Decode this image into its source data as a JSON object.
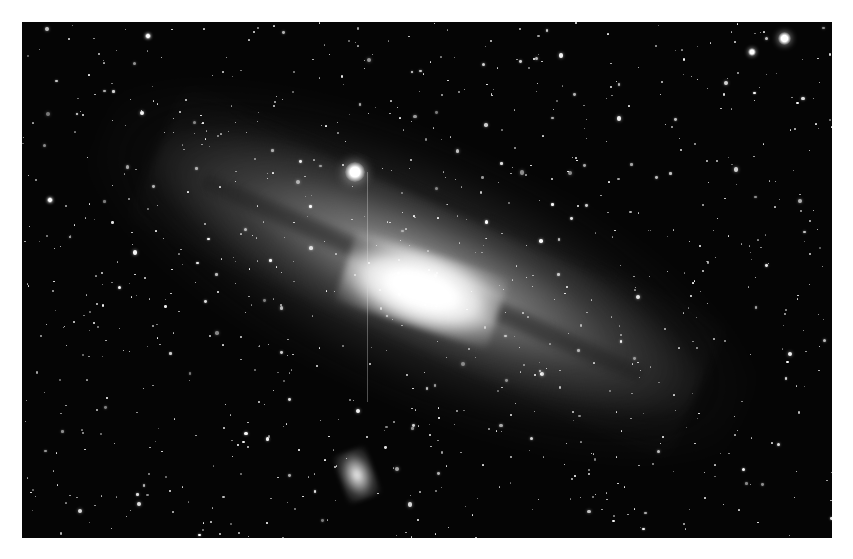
{
  "image": {
    "subject": "Andromeda Galaxy (M31) with companion galaxy",
    "style": "grayscale astrophotograph",
    "frame": {
      "x": 22,
      "y": 22,
      "width": 810,
      "height": 516
    },
    "background_color": "#ffffff",
    "sky_color": "#050505",
    "galaxy": {
      "core_center": [
        420,
        280
      ],
      "tilt_degrees": 24,
      "core_color": "#ffffff"
    },
    "companion_galaxy": {
      "center": [
        355,
        470
      ]
    },
    "bright_stars": [
      {
        "x": 355,
        "y": 172,
        "r": 8
      },
      {
        "x": 784,
        "y": 38,
        "r": 5
      },
      {
        "x": 752,
        "y": 52,
        "r": 3
      },
      {
        "x": 148,
        "y": 36,
        "r": 2
      },
      {
        "x": 50,
        "y": 200,
        "r": 2
      }
    ],
    "star_field_count": 900
  }
}
